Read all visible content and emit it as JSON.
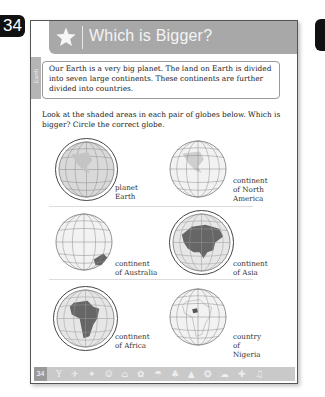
{
  "page_number_badge": "34",
  "header": {
    "icon": "star-icon",
    "title": "Which is Bigger?"
  },
  "side_tab": {
    "label": "Earth"
  },
  "intro": {
    "text": "Our Earth is a very big planet. The land on Earth is divided into seven large continents. These continents are further divided into countries."
  },
  "instructions": "Look at the shaded areas in each pair of globes below. Which is bigger? Circle the correct globe.",
  "pairs": [
    {
      "left": {
        "label_line1": "planet",
        "label_line2": "Earth",
        "circled": true,
        "shaded": "whole globe"
      },
      "right": {
        "label_line1": "continent",
        "label_line2": "of North",
        "label_line3": "America",
        "circled": false,
        "shaded": "North America"
      }
    },
    {
      "left": {
        "label_line1": "continent",
        "label_line2": "of Australia",
        "circled": false,
        "shaded": "Australia"
      },
      "right": {
        "label_line1": "continent",
        "label_line2": "of Asia",
        "circled": true,
        "shaded": "Asia"
      }
    },
    {
      "left": {
        "label_line1": "continent",
        "label_line2": "of Africa",
        "circled": true,
        "shaded": "Africa"
      },
      "right": {
        "label_line1": "country",
        "label_line2": "of Nigeria",
        "circled": false,
        "shaded": "Nigeria"
      }
    }
  ],
  "footer": {
    "page_number": "34",
    "icons": "Y ✈ ✦ ☺ ⌂ ✿ ☂ ♣ ▲ ✪ ☁ ✚ ♫"
  }
}
